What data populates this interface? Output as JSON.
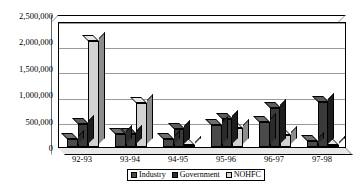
{
  "chart_data": {
    "type": "bar",
    "title": "",
    "xlabel": "",
    "ylabel": "",
    "categories": [
      "92-93",
      "93-94",
      "94-95",
      "95-96",
      "96-97",
      "97-98"
    ],
    "series": [
      {
        "name": "Industry",
        "color": "#4a4a4a",
        "values": [
          150000,
          250000,
          150000,
          430000,
          500000,
          120000
        ]
      },
      {
        "name": "Government",
        "color": "#2f2f2f",
        "values": [
          450000,
          250000,
          350000,
          550000,
          780000,
          900000
        ]
      },
      {
        "name": "NOHFC",
        "color": "#dcdcdc",
        "values": [
          2100000,
          880000,
          30000,
          370000,
          230000,
          30000
        ]
      }
    ],
    "ylim": [
      0,
      2500000
    ],
    "ytick_labels": [
      "0",
      "500,000",
      "1,000,000",
      "1,500,000",
      "2,000,000",
      "2,500,000"
    ],
    "ytick_values": [
      0,
      500000,
      1000000,
      1500000,
      2000000,
      2500000
    ],
    "grid": true,
    "legend_position": "bottom",
    "style": "3d-clustered-column"
  }
}
